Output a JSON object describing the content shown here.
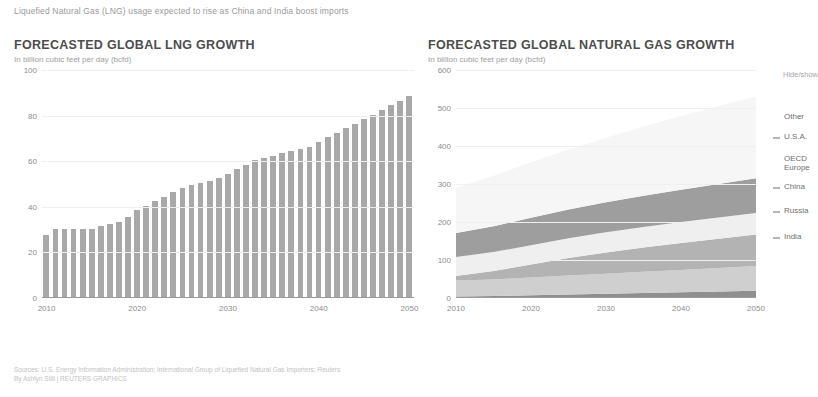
{
  "kicker": "Liquefied Natural Gas (LNG) usage expected to rise as China and India boost imports",
  "left_panel": {
    "title": "FORECASTED GLOBAL LNG GROWTH",
    "subtitle": "In billion cubic feet per day (bcfd)"
  },
  "right_panel": {
    "title": "FORECASTED GLOBAL NATURAL GAS GROWTH",
    "subtitle": "In billion cubic feet per day (bcfd)",
    "hide_show_label": "Hide/show"
  },
  "footer": {
    "sources": "Sources: U.S. Energy Information Administration; International Group of Liquefied Natural Gas Importers; Reuters",
    "byline": "By Ashlyn Still | REUTERS GRAPHICS"
  },
  "chart_data": [
    {
      "type": "bar",
      "title": "FORECASTED GLOBAL LNG GROWTH",
      "subtitle": "In billion cubic feet per day (bcfd)",
      "xlabel": "",
      "ylabel": "In billion cubic feet per day (bcfd)",
      "ylim": [
        0,
        100
      ],
      "yticks": [
        0,
        20,
        40,
        60,
        80,
        100
      ],
      "xticks": [
        2010,
        2020,
        2030,
        2040,
        2050
      ],
      "grid": true,
      "bar_color": "#a8a8a8",
      "categories": [
        2010,
        2011,
        2012,
        2013,
        2014,
        2015,
        2016,
        2017,
        2018,
        2019,
        2020,
        2021,
        2022,
        2023,
        2024,
        2025,
        2026,
        2027,
        2028,
        2029,
        2030,
        2031,
        2032,
        2033,
        2034,
        2035,
        2036,
        2037,
        2038,
        2039,
        2040,
        2041,
        2042,
        2043,
        2044,
        2045,
        2046,
        2047,
        2048,
        2049,
        2050
      ],
      "values": [
        27,
        30,
        30,
        30,
        30,
        30,
        31,
        32,
        33,
        35,
        38,
        40,
        42,
        44,
        46,
        48,
        49,
        50,
        51,
        52,
        54,
        56,
        58,
        60,
        61,
        62,
        63,
        64,
        65,
        66,
        68,
        70,
        72,
        74,
        76,
        78,
        80,
        82,
        84,
        86,
        88
      ]
    },
    {
      "type": "area",
      "title": "FORECASTED GLOBAL NATURAL GAS GROWTH",
      "subtitle": "In billion cubic feet per day (bcfd)",
      "xlabel": "",
      "ylabel": "In billion cubic feet per day (bcfd)",
      "ylim": [
        0,
        600
      ],
      "yticks": [
        0,
        100,
        200,
        300,
        400,
        500,
        600
      ],
      "xticks": [
        2010,
        2020,
        2030,
        2040,
        2050
      ],
      "grid": true,
      "stacked": true,
      "legend_position": "right",
      "x": [
        2010,
        2015,
        2020,
        2025,
        2030,
        2035,
        2040,
        2045,
        2050
      ],
      "series": [
        {
          "name": "India",
          "color": "#8f8f8f",
          "values": [
            4,
            5,
            7,
            9,
            11,
            13,
            15,
            17,
            19
          ]
        },
        {
          "name": "Russia",
          "color": "#cfcfcf",
          "values": [
            42,
            44,
            47,
            50,
            53,
            56,
            59,
            62,
            65
          ]
        },
        {
          "name": "China",
          "color": "#b3b3b3",
          "values": [
            12,
            22,
            34,
            46,
            56,
            64,
            71,
            77,
            83
          ]
        },
        {
          "name": "OECD Europe",
          "color": "#efefef",
          "values": [
            50,
            50,
            51,
            52,
            53,
            54,
            55,
            56,
            57
          ]
        },
        {
          "name": "U.S.A.",
          "color": "#9e9e9e",
          "values": [
            63,
            68,
            72,
            76,
            79,
            82,
            85,
            88,
            91
          ]
        },
        {
          "name": "Other",
          "color": "#f6f6f6",
          "values": [
            119,
            133,
            146,
            158,
            170,
            182,
            194,
            205,
            216
          ]
        }
      ],
      "legend_entries": [
        {
          "label": "Other",
          "has_marker": false,
          "marker_color": "#f6f6f6"
        },
        {
          "label": "U.S.A.",
          "has_marker": true,
          "marker_color": "#9e9e9e"
        },
        {
          "label": "OECD\nEurope",
          "has_marker": false,
          "marker_color": "#efefef"
        },
        {
          "label": "China",
          "has_marker": true,
          "marker_color": "#b3b3b3"
        },
        {
          "label": "Russia",
          "has_marker": true,
          "marker_color": "#cfcfcf"
        },
        {
          "label": "India",
          "has_marker": true,
          "marker_color": "#8f8f8f"
        }
      ]
    }
  ]
}
